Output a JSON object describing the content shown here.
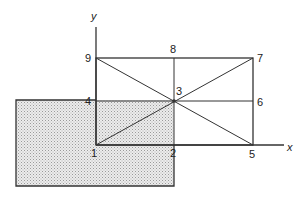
{
  "diagram": {
    "axes": {
      "x_label": "x",
      "y_label": "y"
    },
    "points": [
      {
        "id": "1",
        "label": "1"
      },
      {
        "id": "2",
        "label": "2"
      },
      {
        "id": "3",
        "label": "3"
      },
      {
        "id": "4",
        "label": "4"
      },
      {
        "id": "5",
        "label": "5"
      },
      {
        "id": "6",
        "label": "6"
      },
      {
        "id": "7",
        "label": "7"
      },
      {
        "id": "8",
        "label": "8"
      },
      {
        "id": "9",
        "label": "9"
      }
    ],
    "colors": {
      "line": "#333333",
      "shade": "#d9d9d9",
      "shade_dot": "#9a9a9a"
    }
  }
}
